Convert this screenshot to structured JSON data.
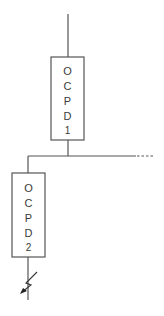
{
  "diagram": {
    "type": "single-line-diagram",
    "devices": [
      {
        "id": "ocpd1",
        "label_chars": [
          "O",
          "C",
          "P",
          "D",
          "1"
        ],
        "label": "OCPD 1"
      },
      {
        "id": "ocpd2",
        "label_chars": [
          "O",
          "C",
          "P",
          "D",
          "2"
        ],
        "label": "OCPD 2"
      }
    ],
    "fault_symbol": "fault-arrow",
    "colors": {
      "line": "#555555",
      "box_stroke": "#555555",
      "text": "#3a3a3a",
      "background": "#ffffff"
    }
  }
}
